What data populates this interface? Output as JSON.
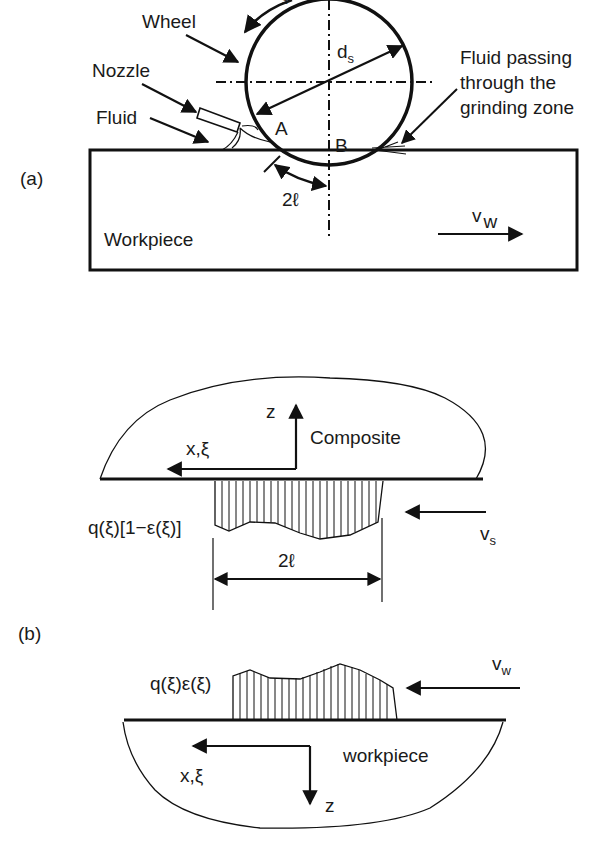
{
  "figure": {
    "panel_a": {
      "label": "(a)",
      "wheel_label": "Wheel",
      "nozzle_label": "Nozzle",
      "fluid_label": "Fluid",
      "fluid_passing_label_line1": "Fluid passing",
      "fluid_passing_label_line2": "through the",
      "fluid_passing_label_line3": "grinding zone",
      "diameter_label": "d",
      "diameter_subscript": "s",
      "point_a": "A",
      "point_b": "B",
      "contact_length_label": "2ℓ",
      "workpiece_label": "Workpiece",
      "workpiece_velocity_label": "v",
      "workpiece_velocity_subscript": "w",
      "wheel_velocity_partial": "s"
    },
    "panel_b": {
      "label": "(b)",
      "composite_label": "Composite",
      "composite_axis_z": "z",
      "composite_axis_x": "x,ξ",
      "composite_flux_label": "q(ξ)[1−ε(ξ)]",
      "wheel_velocity_label": "v",
      "wheel_velocity_subscript": "s",
      "contact_length_label": "2ℓ",
      "workpiece_flux_label": "q(ξ)ε(ξ)",
      "workpiece_velocity_label": "v",
      "workpiece_velocity_subscript": "w",
      "workpiece_label": "workpiece",
      "workpiece_axis_x": "x,ξ",
      "workpiece_axis_z": "z"
    }
  }
}
